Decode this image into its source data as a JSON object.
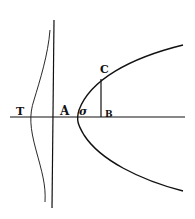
{
  "diagram": {
    "type": "geometric figure (parabola with tangent construction)",
    "stroke_color": "#111111",
    "background": "#ffffff",
    "labels": {
      "T": "T",
      "A": "A",
      "sigma": "σ",
      "B": "B",
      "C": "C"
    },
    "elements": [
      {
        "name": "horizontal-axis",
        "kind": "line"
      },
      {
        "name": "vertical-line",
        "kind": "line"
      },
      {
        "name": "wavy-curve",
        "kind": "curve"
      },
      {
        "name": "parabola",
        "kind": "curve"
      },
      {
        "name": "ordinate-CB",
        "kind": "line segment"
      }
    ]
  }
}
